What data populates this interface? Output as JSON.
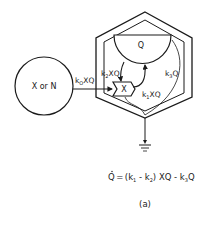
{
  "figure": {
    "caption": "(a)",
    "colors": {
      "ink": "#1a1a1a",
      "background": "#ffffff"
    }
  },
  "nodes": {
    "source": {
      "label": "X or N",
      "shape": "circle"
    },
    "storage": {
      "label": "Q",
      "shape": "semicircle"
    },
    "controller": {
      "label": "X",
      "shape": "valve-arrow"
    },
    "container": {
      "shape": "double-hexagon"
    },
    "sink": {
      "shape": "ground-symbol",
      "icon": "ground-icon"
    }
  },
  "flows": {
    "input": {
      "k": "k",
      "sub": "O",
      "tail": "XQ"
    },
    "k2": {
      "k": "k",
      "sub": "2",
      "tail": "XQ"
    },
    "k1": {
      "k": "k",
      "sub": "1",
      "tail": "XQ"
    },
    "k3": {
      "k": "k",
      "sub": "3",
      "tail": "Q"
    }
  },
  "equation": {
    "lhs": "Q",
    "equals": "=",
    "open": "(k",
    "sub1": "1",
    "minus1": " - k",
    "sub2": "2",
    "mid": ") XQ - k",
    "sub3": "3",
    "end": "Q"
  }
}
